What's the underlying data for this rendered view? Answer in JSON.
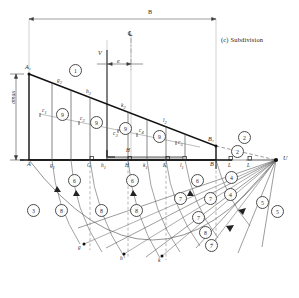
{
  "figure": {
    "caption": "(c) Subdivision",
    "type": "engineering-construction-diagram"
  },
  "dimensions": {
    "width_label": "B",
    "centerline_symbol": "℄",
    "eccentricity_label": "e",
    "resultant_label": "V",
    "max_stress_label": "σmax"
  },
  "points": {
    "top_left": "A₁",
    "top_right": "B₁",
    "base_left": "A",
    "base_right": "B",
    "pole": "U"
  },
  "base_labels": [
    {
      "text": "A",
      "sub": ""
    },
    {
      "text": "g",
      "sub": "1"
    },
    {
      "text": "G",
      "sub": ""
    },
    {
      "text": "h",
      "sub": "1"
    },
    {
      "text": "H",
      "sub": ""
    },
    {
      "text": "k",
      "sub": "1"
    },
    {
      "text": "K",
      "sub": ""
    },
    {
      "text": "l",
      "sub": "1"
    },
    {
      "text": "L",
      "sub": ""
    },
    {
      "text": "B",
      "sub": ""
    }
  ],
  "top_edge_labels": [
    {
      "text": "g",
      "sub": "2"
    },
    {
      "text": "h",
      "sub": "2"
    },
    {
      "text": "k",
      "sub": "2"
    },
    {
      "text": "l",
      "sub": "2"
    }
  ],
  "centroid_labels": [
    {
      "text": "c",
      "sub": "1"
    },
    {
      "text": "c",
      "sub": "2"
    },
    {
      "text": "c",
      "sub": "3"
    },
    {
      "text": "c",
      "sub": "4"
    },
    {
      "text": "c",
      "sub": "5"
    }
  ],
  "arc_labels": [
    {
      "text": "g"
    },
    {
      "text": "h"
    },
    {
      "text": "k"
    },
    {
      "text": "l"
    }
  ],
  "step_numbers": {
    "n1": "1",
    "n2": "2",
    "n3": "3",
    "n4": "4",
    "n5": "5",
    "n6": "6",
    "n7": "7",
    "n8": "8",
    "n9": "9"
  },
  "colors": {
    "ink": "#1a1a1a",
    "thin": "#6f6f6f",
    "construction": "#8a8a8a",
    "paper": "#ffffff"
  }
}
